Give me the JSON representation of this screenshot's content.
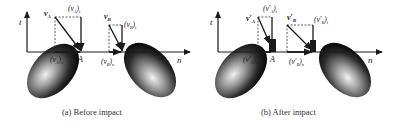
{
  "figure": {
    "panels": [
      {
        "id": "a",
        "caption": "(a) Before impact",
        "axis_t": "t",
        "axis_n": "n",
        "point_a": "A",
        "vA": "v",
        "vA_sub": "A",
        "vA_t": "(v",
        "vA_t_sub": "A",
        "vA_t_tail": ")",
        "vA_t_comp": "t",
        "vA_n": "(v",
        "vA_n_sub": "A",
        "vA_n_tail": ")",
        "vA_n_comp": "n",
        "vB": "v",
        "vB_sub": "B",
        "vB_t": "(v",
        "vB_t_sub": "B",
        "vB_t_tail": ")",
        "vB_t_comp": "t",
        "vB_n": "(v",
        "vB_n_sub": "B",
        "vB_n_tail": ")",
        "vB_n_comp": "n"
      },
      {
        "id": "b",
        "caption": "(b) After impact",
        "axis_t": "t",
        "axis_n": "n",
        "point_a": "A",
        "vA": "v′",
        "vA_sub": "A",
        "vA_t": "(v′",
        "vA_t_sub": "A",
        "vA_t_tail": ")",
        "vA_t_comp": "t",
        "vA_n": "(v′",
        "vA_n_sub": "A",
        "vA_n_tail": ")",
        "vA_n_comp": "n",
        "vB": "v′",
        "vB_sub": "B",
        "vB_t": "(v′",
        "vB_t_sub": "B",
        "vB_t_tail": ")",
        "vB_t_comp": "t",
        "vB_n": "(v′",
        "vB_n_sub": "B",
        "vB_n_tail": ")",
        "vB_n_comp": "n"
      }
    ],
    "colors": {
      "ink": "#1a1a1a",
      "body_dark": "#111111",
      "body_light": "#e8e8e8"
    }
  }
}
